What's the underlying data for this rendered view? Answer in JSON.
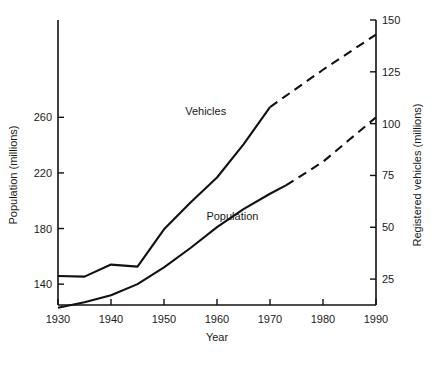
{
  "chart_data": {
    "type": "line",
    "title": "",
    "xlabel": "Year",
    "ylabel": "Population (millions)",
    "y2label": "Registered vehicles (millions)",
    "grid": false,
    "legend_position": "inline-labels",
    "xlim": [
      1930,
      1990
    ],
    "ylim": [
      125,
      330
    ],
    "y2lim": [
      12.5,
      150
    ],
    "xticks": [
      1930,
      1940,
      1950,
      1960,
      1970,
      1980,
      1990
    ],
    "xticklabels": [
      "1930",
      "1940",
      "1950",
      "1960",
      "1970",
      "1980",
      "1990"
    ],
    "yticks": [
      140,
      180,
      220,
      260
    ],
    "yticklabels": [
      "140",
      "180",
      "220",
      "260"
    ],
    "y2ticks": [
      25,
      50,
      75,
      100,
      125,
      150
    ],
    "y2ticklabels": [
      "25",
      "50",
      "75",
      "100",
      "125",
      "150"
    ],
    "series": [
      {
        "name": "Population",
        "label": "Population",
        "axis": "left",
        "units": "millions",
        "x": [
          1930,
          1935,
          1940,
          1945,
          1950,
          1955,
          1960,
          1965,
          1970,
          1973
        ],
        "values": [
          123,
          127,
          132,
          140,
          152,
          166,
          181,
          194,
          205,
          211
        ],
        "projected_x": [
          1973,
          1980,
          1985,
          1990
        ],
        "projected_values": [
          211,
          228,
          244,
          260
        ],
        "label_x": 1958,
        "label_y": 186
      },
      {
        "name": "Vehicles",
        "label": "Vehicles",
        "axis": "right",
        "units": "millions",
        "x": [
          1930,
          1935,
          1940,
          1945,
          1950,
          1955,
          1960,
          1965,
          1970
        ],
        "values": [
          26.5,
          26.2,
          32.0,
          31.0,
          49.0,
          62.0,
          74.0,
          90.0,
          108.0
        ],
        "projected_x": [
          1970,
          1980,
          1990
        ],
        "projected_values": [
          108.0,
          126.0,
          143.0
        ],
        "label_x": 1954,
        "label_y": 104
      }
    ],
    "annotations": [
      {
        "text": "Vehicles",
        "x": 1954,
        "y_axis": "right",
        "y": 104
      },
      {
        "text": "Population",
        "x": 1958,
        "y_axis": "left",
        "y": 186
      }
    ]
  },
  "figure": {
    "caption": ""
  }
}
